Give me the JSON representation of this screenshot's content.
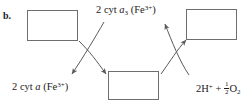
{
  "figure": {
    "panel_label": "b.",
    "background_color": "#ffffff",
    "stroke_color": "#6e6e6e",
    "text_color": "#1a1a1a"
  },
  "boxes": [
    {
      "id": "top-left",
      "label": "",
      "x": 27,
      "y": 10,
      "width": 51,
      "height": 31
    },
    {
      "id": "top-right",
      "label": "",
      "x": 186,
      "y": 9,
      "width": 51,
      "height": 31
    },
    {
      "id": "bottom-center",
      "label": "",
      "x": 108,
      "y": 71,
      "width": 51,
      "height": 29
    }
  ],
  "labels": {
    "top_center": {
      "text": "2 cyt a3 (Fe3+)",
      "coefficient": "2",
      "species": "cyt",
      "italic_part": "a",
      "subscript": "3",
      "metal": "Fe",
      "charge": "3+"
    },
    "bottom_left": {
      "text": "2 cyt a (Fe3+)",
      "coefficient": "2",
      "species": "cyt",
      "italic_part": "a",
      "metal": "Fe",
      "charge": "3+"
    },
    "bottom_right": {
      "text": "2H+ + 1/2 O2",
      "protons_coefficient": "2",
      "proton_symbol": "H",
      "proton_charge": "+",
      "plus_sign": "+",
      "fraction_numerator": "1",
      "fraction_denominator": "2",
      "oxygen_symbol": "O",
      "oxygen_subscript": "2"
    }
  },
  "arrows": [
    {
      "id": "left-down-right",
      "from": "box-top-left",
      "to": "box-bottom-center",
      "direction": "down-right"
    },
    {
      "id": "left-down-left",
      "from": "label-top-center",
      "to": "label-bottom-left",
      "direction": "down-left"
    },
    {
      "id": "right-up-left",
      "from": "label-bottom-right",
      "to": "label-top-center",
      "direction": "up-left"
    },
    {
      "id": "right-up-right",
      "from": "box-bottom-center",
      "to": "box-top-right",
      "direction": "up-right"
    }
  ]
}
